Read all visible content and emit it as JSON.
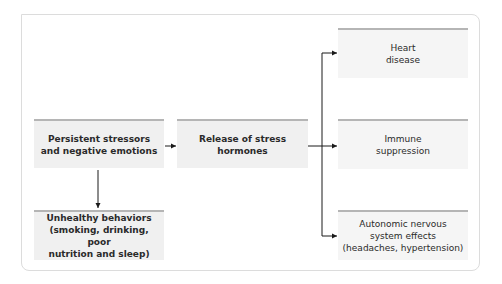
{
  "diagram": {
    "nodes": {
      "stressors": {
        "label": "Persistent stressors\nand negative emotions"
      },
      "hormones": {
        "label": "Release of stress\nhormones"
      },
      "heart": {
        "label": "Heart\ndisease"
      },
      "immune": {
        "label": "Immune\nsuppression"
      },
      "autonomic": {
        "label": "Autonomic nervous\nsystem effects\n(headaches, hypertension)"
      },
      "behaviors": {
        "label": "Unhealthy behaviors\n(smoking, drinking, poor\nnutrition and sleep)"
      }
    },
    "edges": [
      {
        "from": "stressors",
        "to": "hormones"
      },
      {
        "from": "stressors",
        "to": "behaviors"
      },
      {
        "from": "hormones",
        "to": "heart"
      },
      {
        "from": "hormones",
        "to": "immune"
      },
      {
        "from": "hormones",
        "to": "autonomic"
      }
    ],
    "colors": {
      "box_fill": "#f0f0f0",
      "box_top_rule": "#b5b5b5",
      "text": "#2a2a2a",
      "connector": "#1a1a1a",
      "frame_border": "#dcdcdc"
    }
  }
}
